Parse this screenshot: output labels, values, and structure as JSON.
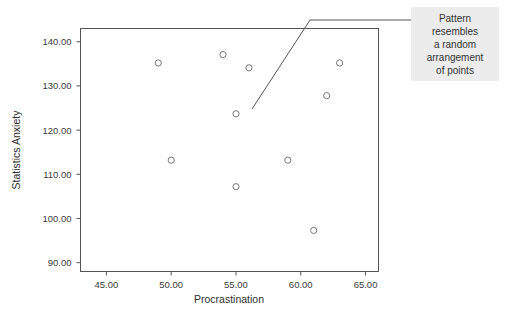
{
  "figure": {
    "title": "",
    "background_color": "#ffffff",
    "frame_color": "#555555",
    "marker_color": "#777777",
    "annotation_bg": "#ececec"
  },
  "annotation": {
    "name": "pattern-callout",
    "lines": [
      "Pattern",
      "resembles",
      "a random",
      "arrangement",
      "of points"
    ]
  },
  "axes": {
    "x": {
      "label": "Procrastination",
      "ticks": [
        "45.00",
        "50.00",
        "55.00",
        "60.00",
        "65.00"
      ],
      "tick_values": [
        45,
        50,
        55,
        60,
        65
      ],
      "range": [
        43.0,
        66.0
      ]
    },
    "y": {
      "label": "Statistics Anxiety",
      "ticks": [
        "90.00",
        "100.00",
        "110.00",
        "120.00",
        "130.00",
        "140.00"
      ],
      "tick_values": [
        90,
        100,
        110,
        120,
        130,
        140
      ],
      "range": [
        88.0,
        143.0
      ]
    }
  },
  "chart_data": {
    "type": "scatter",
    "title": "",
    "xlabel": "Procrastination",
    "ylabel": "Statistics Anxiety",
    "xlim": [
      43.0,
      66.0
    ],
    "ylim": [
      88.0,
      143.0
    ],
    "xticks": [
      45,
      50,
      55,
      60,
      65
    ],
    "yticks": [
      90,
      100,
      110,
      120,
      130,
      140
    ],
    "xtick_labels": [
      "45.00",
      "50.00",
      "55.00",
      "60.00",
      "65.00"
    ],
    "ytick_labels": [
      "90.00",
      "100.00",
      "110.00",
      "120.00",
      "130.00",
      "140.00"
    ],
    "grid": false,
    "legend": null,
    "marker": "open-circle",
    "points": [
      {
        "x": 49,
        "y": 135.2
      },
      {
        "x": 54,
        "y": 137.1
      },
      {
        "x": 56,
        "y": 134.1
      },
      {
        "x": 55,
        "y": 123.7
      },
      {
        "x": 50,
        "y": 113.2
      },
      {
        "x": 55,
        "y": 107.2
      },
      {
        "x": 59,
        "y": 113.2
      },
      {
        "x": 63,
        "y": 135.2
      },
      {
        "x": 62,
        "y": 127.8
      },
      {
        "x": 61,
        "y": 97.3
      }
    ],
    "annotations": [
      {
        "text": "Pattern resembles a random arrangement of points",
        "points_to": {
          "x": 56.6,
          "y": 123.5
        }
      }
    ]
  }
}
